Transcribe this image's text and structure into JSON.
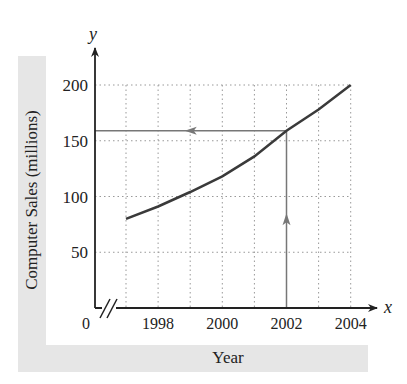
{
  "chart_data": {
    "type": "line",
    "title": "",
    "xlabel": "Year",
    "ylabel": "Computer Sales (millions)",
    "x_axis_symbol": "x",
    "y_axis_symbol": "y",
    "origin_label": "0",
    "x_ticks": [
      1998,
      2000,
      2002,
      2004
    ],
    "y_ticks": [
      50,
      100,
      150,
      200
    ],
    "xlim": [
      1997,
      2004
    ],
    "ylim": [
      0,
      200
    ],
    "grid": true,
    "axis_break": "x",
    "series": [
      {
        "name": "Computer Sales",
        "x": [
          1997,
          1998,
          1999,
          2000,
          2001,
          2002,
          2003,
          2004
        ],
        "values": [
          80,
          91,
          104,
          118,
          136,
          159,
          178,
          200
        ]
      }
    ],
    "annotations": [
      {
        "type": "arrow",
        "from": [
          2002,
          0
        ],
        "to": [
          2002,
          159
        ],
        "direction": "up"
      },
      {
        "type": "arrow",
        "from": [
          2002,
          159
        ],
        "to": [
          1997,
          159
        ],
        "direction": "left"
      }
    ],
    "colors": {
      "curve": "#3a3a3a",
      "axis": "#333333",
      "annotation": "#777777",
      "grid": "#999999",
      "label_band": "#e6e6e6"
    }
  }
}
